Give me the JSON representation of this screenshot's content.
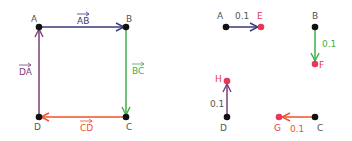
{
  "colors": {
    "ab": "#3b3a7a",
    "bc": "#3fae49",
    "cd": "#f0522b",
    "da": "#7b3f7a",
    "point": "#111111",
    "new_point": "#e8365c",
    "label": "#555555"
  },
  "left": {
    "points": {
      "A": "A",
      "B": "B",
      "C": "C",
      "D": "D"
    },
    "vectors": {
      "ab": "AB",
      "bc": "BC",
      "cd": "CD",
      "da": "DA"
    }
  },
  "right": {
    "points": {
      "A": "A",
      "B": "B",
      "C": "C",
      "D": "D",
      "E": "E",
      "F": "F",
      "G": "G",
      "H": "H"
    },
    "scale_labels": {
      "ae": "0.1",
      "bf": "0.1",
      "cg": "0.1",
      "dh": "0.1"
    }
  }
}
